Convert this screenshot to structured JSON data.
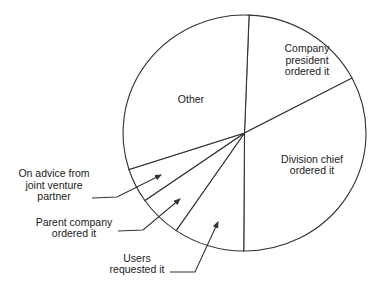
{
  "chart_data": {
    "type": "pie",
    "title": "",
    "start": "12 o'clock",
    "direction": "clockwise",
    "unit": "percent (estimated from slice angles)",
    "slices": [
      {
        "label": "Company president ordered it",
        "lines": [
          "Company",
          "president",
          "ordered it"
        ],
        "value": 16.7,
        "label_placement": "inside"
      },
      {
        "label": "Division chief ordered it",
        "lines": [
          "Division chief",
          "ordered it"
        ],
        "value": 32.8,
        "label_placement": "inside"
      },
      {
        "label": "Users requested it",
        "lines": [
          "Users",
          "requested it"
        ],
        "value": 9.4,
        "label_placement": "outside-callout"
      },
      {
        "label": "Parent company ordered it",
        "lines": [
          "Parent company",
          "ordered it"
        ],
        "value": 5.8,
        "label_placement": "outside-callout"
      },
      {
        "label": "On advice from joint venture partner",
        "lines": [
          "On advice from",
          "joint venture",
          "partner"
        ],
        "value": 4.7,
        "label_placement": "outside-callout"
      },
      {
        "label": "Other",
        "lines": [
          "Other"
        ],
        "value": 30.6,
        "label_placement": "inside"
      }
    ],
    "start_offset_percent": 0.6,
    "legend": "none"
  }
}
